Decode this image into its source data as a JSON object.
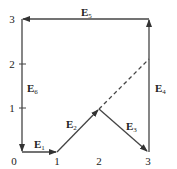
{
  "diagram": {
    "type": "vector-path",
    "axes": {
      "x_ticks": [
        "0",
        "1",
        "2",
        "3"
      ],
      "y_ticks": [
        "1",
        "2",
        "3"
      ]
    },
    "vectors": [
      {
        "name": "E",
        "sub": "1",
        "from": [
          0,
          0
        ],
        "to": [
          1,
          0
        ]
      },
      {
        "name": "E",
        "sub": "2",
        "from": [
          1,
          0
        ],
        "to": [
          2,
          1
        ]
      },
      {
        "name": "E",
        "sub": "3",
        "from": [
          2,
          1
        ],
        "to": [
          3,
          0
        ]
      },
      {
        "name": "E",
        "sub": "4",
        "from": [
          3,
          0
        ],
        "to": [
          3,
          3
        ]
      },
      {
        "name": "E",
        "sub": "5",
        "from": [
          3,
          3
        ],
        "to": [
          0,
          3
        ]
      },
      {
        "name": "E",
        "sub": "6",
        "from": [
          0,
          3
        ],
        "to": [
          0,
          0
        ]
      }
    ],
    "dashed_extension": {
      "from": [
        2,
        1
      ],
      "to": [
        3,
        2
      ]
    },
    "colors": {
      "line": "#333333",
      "text": "#222222"
    }
  }
}
